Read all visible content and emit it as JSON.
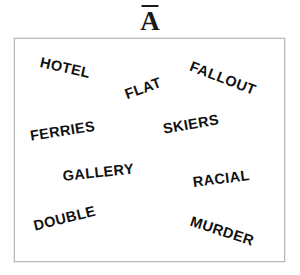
{
  "title": {
    "label": "A",
    "accent": "macron",
    "display": "Ā"
  },
  "panel": {
    "background_color": "#ffffff",
    "border_color": "#b8b8b8",
    "text_color": "#111111"
  },
  "words": [
    {
      "id": "hotel",
      "text": "HOTEL"
    },
    {
      "id": "flat",
      "text": "FLAT"
    },
    {
      "id": "fallout",
      "text": "FALLOUT"
    },
    {
      "id": "ferries",
      "text": "FERRIES"
    },
    {
      "id": "skiers",
      "text": "SKIERS"
    },
    {
      "id": "gallery",
      "text": "GALLERY"
    },
    {
      "id": "racial",
      "text": "RACIAL"
    },
    {
      "id": "double",
      "text": "DOUBLE"
    },
    {
      "id": "murder",
      "text": "MURDER"
    }
  ]
}
